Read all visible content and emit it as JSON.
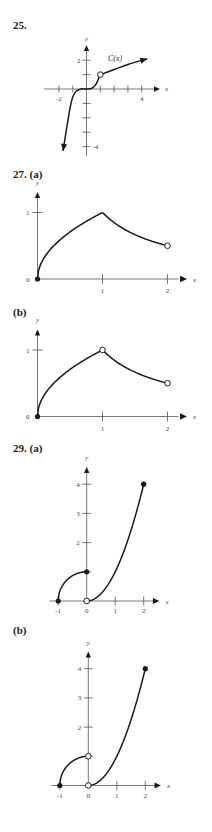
{
  "page": {
    "colors": {
      "ink": "#1a1a1a",
      "axis": "#555555",
      "text": "#444444",
      "background": "#ffffff"
    }
  },
  "problems": [
    {
      "number": "25.",
      "part": ""
    },
    {
      "number": "27.",
      "part": "(a)"
    },
    {
      "number": "",
      "part": "(b)"
    },
    {
      "number": "29.",
      "part": "(a)"
    },
    {
      "number": "",
      "part": "(b)"
    }
  ],
  "chart_data": [
    {
      "id": "25",
      "type": "line",
      "title": "25.",
      "xlabel": "x",
      "ylabel": "y",
      "curve_label": "C(x)",
      "xlim": [
        -2,
        5
      ],
      "ylim": [
        -4.5,
        2.5
      ],
      "x_ticks": [
        -2,
        -1,
        0,
        1,
        2,
        3,
        4
      ],
      "x_tick_labels": {
        "-2": "-2",
        "4": "4"
      },
      "y_ticks": [
        -4,
        -3,
        -2,
        -1,
        1,
        2
      ],
      "y_tick_labels": {
        "2": "2",
        "-4": "-4"
      },
      "series": [
        {
          "name": "C(x) left branch",
          "points": [
            [
              -1.7,
              -4.3
            ],
            [
              -1.4,
              -2.5
            ],
            [
              -1.1,
              -0.9
            ],
            [
              -0.8,
              -0.2
            ],
            [
              -0.4,
              0.0
            ],
            [
              0,
              0.0
            ],
            [
              0.4,
              0.05
            ],
            [
              0.7,
              0.35
            ],
            [
              1,
              1
            ]
          ],
          "arrow_start": true
        },
        {
          "name": "C(x) right branch",
          "points": [
            [
              1,
              1
            ],
            [
              2,
              1.35
            ],
            [
              3,
              1.7
            ],
            [
              4.4,
              2.1
            ]
          ],
          "arrow_end": true
        }
      ],
      "markers": [
        {
          "x": 1,
          "y": 1,
          "style": "open"
        }
      ],
      "grid": false
    },
    {
      "id": "27a",
      "type": "line",
      "title": "27. (a)",
      "xlabel": "x",
      "ylabel": "y",
      "xlim": [
        0,
        2.2
      ],
      "ylim": [
        0,
        1.25
      ],
      "x_ticks": [
        1,
        2
      ],
      "x_tick_labels": [
        "1",
        "2"
      ],
      "y_ticks": [
        1
      ],
      "y_tick_labels": [
        "1"
      ],
      "origin_label": "0",
      "series": [
        {
          "name": "sqrt(x)",
          "domain": [
            0,
            1
          ]
        },
        {
          "name": "1/x",
          "domain": [
            1,
            2
          ]
        }
      ],
      "markers": [
        {
          "x": 0,
          "y": 0,
          "style": "filled"
        },
        {
          "x": 2,
          "y": 0.5,
          "style": "open"
        }
      ],
      "grid": false
    },
    {
      "id": "27b",
      "type": "line",
      "title": "(b)",
      "xlabel": "x",
      "ylabel": "y",
      "xlim": [
        0,
        2.2
      ],
      "ylim": [
        0,
        1.25
      ],
      "x_ticks": [
        1,
        2
      ],
      "x_tick_labels": [
        "1",
        "2"
      ],
      "y_ticks": [
        1
      ],
      "y_tick_labels": [
        "1"
      ],
      "origin_label": "0",
      "series": [
        {
          "name": "sqrt(x)",
          "domain": [
            0,
            1
          ]
        },
        {
          "name": "1/x",
          "domain": [
            1,
            2
          ]
        }
      ],
      "markers": [
        {
          "x": 0,
          "y": 0,
          "style": "filled"
        },
        {
          "x": 1,
          "y": 1,
          "style": "open"
        },
        {
          "x": 2,
          "y": 0.5,
          "style": "open"
        }
      ],
      "grid": false
    },
    {
      "id": "29a",
      "type": "line",
      "title": "29. (a)",
      "xlabel": "x",
      "ylabel": "y",
      "xlim": [
        -1.2,
        2.5
      ],
      "ylim": [
        0,
        4.5
      ],
      "x_ticks": [
        -1,
        0,
        1,
        2
      ],
      "x_tick_labels": [
        "-1",
        "0",
        "1",
        "2"
      ],
      "y_ticks": [
        1,
        2,
        3,
        4
      ],
      "y_tick_labels": [
        "2",
        "3",
        "4"
      ],
      "series": [
        {
          "name": "sqrt(1-x^2)",
          "domain": [
            -1,
            0
          ]
        },
        {
          "name": "x^2",
          "domain": [
            0,
            2
          ]
        }
      ],
      "markers": [
        {
          "x": -1,
          "y": 0,
          "style": "filled"
        },
        {
          "x": 0,
          "y": 1,
          "style": "filled"
        },
        {
          "x": 0,
          "y": 0,
          "style": "open"
        },
        {
          "x": 2,
          "y": 4,
          "style": "filled"
        }
      ],
      "grid": false
    },
    {
      "id": "29b",
      "type": "line",
      "title": "(b)",
      "xlabel": "x",
      "ylabel": "y",
      "xlim": [
        -1.2,
        2.5
      ],
      "ylim": [
        0,
        4.5
      ],
      "x_ticks": [
        -1,
        0,
        1,
        2
      ],
      "x_tick_labels": [
        "-1",
        "0",
        "1",
        "2"
      ],
      "y_ticks": [
        1,
        2,
        3,
        4
      ],
      "y_tick_labels": [
        "2",
        "3",
        "4"
      ],
      "series": [
        {
          "name": "sqrt(1-x^2)",
          "domain": [
            -1,
            0
          ]
        },
        {
          "name": "x^2",
          "domain": [
            0,
            2
          ]
        }
      ],
      "markers": [
        {
          "x": -1,
          "y": 0,
          "style": "filled"
        },
        {
          "x": 0,
          "y": 1,
          "style": "open"
        },
        {
          "x": 0,
          "y": 0,
          "style": "open"
        },
        {
          "x": 2,
          "y": 4,
          "style": "filled"
        }
      ],
      "grid": false
    }
  ]
}
